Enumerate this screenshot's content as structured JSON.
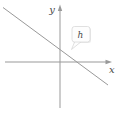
{
  "figure": {
    "background": "#ffffff",
    "colors": {
      "axis": "#999999",
      "line": "#999999",
      "label": "#4a4a4a",
      "tooltip_bg": "#fdfdfd",
      "tooltip_border": "#d6d6d6",
      "tooltip_shadow": "#ececec"
    },
    "axes": {
      "x": {
        "label": "x",
        "path": "M5 62 H107",
        "arrow": "112,62 105.5,59.8 105.5,64.2"
      },
      "y": {
        "label": "y",
        "path": "M60 10 V108",
        "arrow": "60,4.5 57.8,11 62.2,11"
      }
    },
    "line": {
      "path": "M3 7.5 L108 85"
    },
    "tooltip": {
      "label": "h",
      "tail": "75,41 82,41 71.5,49.5"
    }
  }
}
